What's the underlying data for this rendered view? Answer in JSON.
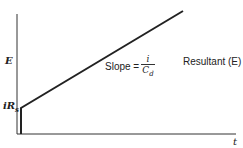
{
  "diagram": {
    "y_axis_label": "E",
    "x_axis_label": "t",
    "intercept_label": "iR",
    "intercept_subscript": "s",
    "slope_text": "Slope =",
    "slope_numerator": "i",
    "slope_denominator": "C",
    "slope_denominator_subscript": "d",
    "curve_label": "Resultant (E)"
  }
}
